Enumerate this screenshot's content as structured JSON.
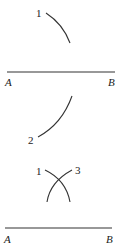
{
  "figure": {
    "stroke_color": "#333333",
    "panel1": {
      "arc_label": "1",
      "segment": {
        "start_label": "A",
        "end_label": "B"
      }
    },
    "panel2": {
      "arc_label": "2"
    },
    "panel3": {
      "arc_label_left": "1",
      "arc_label_right": "3",
      "segment": {
        "start_label": "A",
        "end_label": "B"
      }
    }
  }
}
